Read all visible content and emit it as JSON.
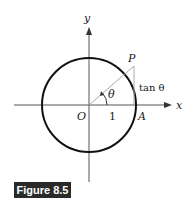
{
  "figure": {
    "caption": "Figure 8.5",
    "labels": {
      "y_axis": "y",
      "x_axis": "x",
      "origin": "O",
      "point_p": "P",
      "point_a": "A",
      "radius": "1",
      "angle": "θ",
      "tangent": "tan θ"
    },
    "colors": {
      "circle": "#111111",
      "axes": "#444444",
      "radius_line": "#aaaaaa",
      "caption_bg": "#2a2a2a",
      "caption_text": "#ffffff"
    }
  }
}
